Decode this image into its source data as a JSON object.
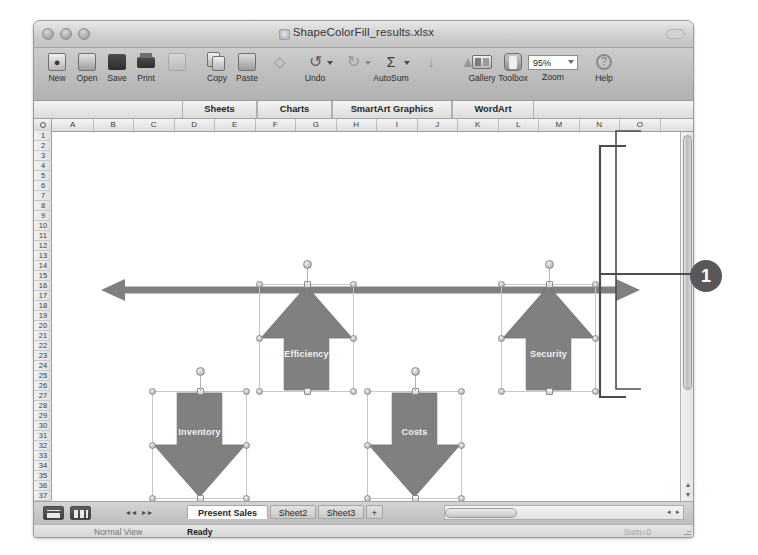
{
  "window": {
    "title": "ShapeColorFill_results.xlsx",
    "doc_icon": "xlsx-document-icon",
    "traffic_lights": [
      "close-button",
      "minimize-button",
      "zoom-button"
    ]
  },
  "toolbar": {
    "items": [
      {
        "label": "New",
        "icon": "new-document-icon",
        "enabled": true
      },
      {
        "label": "Open",
        "icon": "open-folder-icon",
        "enabled": true
      },
      {
        "label": "Save",
        "icon": "save-disk-icon",
        "enabled": true
      },
      {
        "label": "Print",
        "icon": "printer-icon",
        "enabled": true
      },
      {
        "label": "",
        "icon": "print-preview-icon",
        "enabled": false
      },
      {
        "label": "Copy",
        "icon": "copy-icon",
        "enabled": true
      },
      {
        "label": "Paste",
        "icon": "paste-icon",
        "enabled": true
      },
      {
        "label": "",
        "icon": "format-painter-icon",
        "enabled": false
      },
      {
        "label": "Undo",
        "icon": "undo-arrow-icon",
        "enabled": true
      },
      {
        "label": "",
        "icon": "redo-arrow-icon",
        "enabled": false
      },
      {
        "label": "AutoSum",
        "icon": "autosum-sigma-icon",
        "enabled": true
      },
      {
        "label": "",
        "icon": "sort-ascending-icon",
        "enabled": false
      },
      {
        "label": "",
        "icon": "chart-wizard-icon",
        "enabled": false
      },
      {
        "label": "Gallery",
        "icon": "gallery-icon",
        "enabled": true
      },
      {
        "label": "Toolbox",
        "icon": "toolbox-icon",
        "enabled": true
      },
      {
        "label": "Zoom",
        "icon": "zoom-field-icon",
        "enabled": true
      },
      {
        "label": "Help",
        "icon": "help-question-icon",
        "enabled": true
      }
    ],
    "zoom_value": "95%"
  },
  "ribbon": {
    "tabs": [
      {
        "label": "Sheets"
      },
      {
        "label": "Charts"
      },
      {
        "label": "SmartArt Graphics"
      },
      {
        "label": "WordArt"
      }
    ]
  },
  "grid": {
    "columns": [
      "A",
      "B",
      "C",
      "D",
      "E",
      "F",
      "G",
      "H",
      "I",
      "J",
      "K",
      "L",
      "M",
      "N",
      "O"
    ],
    "rows": [
      1,
      2,
      3,
      4,
      5,
      6,
      7,
      8,
      9,
      10,
      11,
      12,
      13,
      14,
      15,
      16,
      17,
      18,
      19,
      20,
      21,
      22,
      23,
      24,
      25,
      26,
      27,
      28,
      29,
      30,
      31,
      32,
      33,
      34,
      35,
      36,
      37
    ],
    "select_all_icon": "select-all-corner-icon"
  },
  "smartart": {
    "type": "diverging-arrows",
    "fill_color": "#808080",
    "text_color": "#f2f2f2",
    "axis_arrow": "double-headed-horizontal-arrow",
    "shapes": [
      {
        "label": "Inventory",
        "direction": "down",
        "x": 118,
        "y": 272,
        "w": 95,
        "h": 108
      },
      {
        "label": "Efficiency",
        "direction": "up",
        "x": 225,
        "y": 165,
        "w": 95,
        "h": 108
      },
      {
        "label": "Costs",
        "direction": "down",
        "x": 333,
        "y": 272,
        "w": 95,
        "h": 108
      },
      {
        "label": "Security",
        "direction": "up",
        "x": 467,
        "y": 165,
        "w": 95,
        "h": 108
      }
    ]
  },
  "annotation": {
    "badge_label": "1",
    "badge_color": "#58585a",
    "bracket_name": "callout-bracket"
  },
  "bottom": {
    "view_buttons": [
      "normal-view-button",
      "page-layout-view-button"
    ],
    "nav_arrows": "sheet-navigation-arrows",
    "sheet_tabs": [
      {
        "label": "Present Sales",
        "active": true
      },
      {
        "label": "Sheet2",
        "active": false
      },
      {
        "label": "Sheet3",
        "active": false
      },
      {
        "label": "+",
        "active": false
      }
    ]
  },
  "status": {
    "view_mode": "Normal View",
    "message": "Ready",
    "right_note": "Sum=0"
  }
}
